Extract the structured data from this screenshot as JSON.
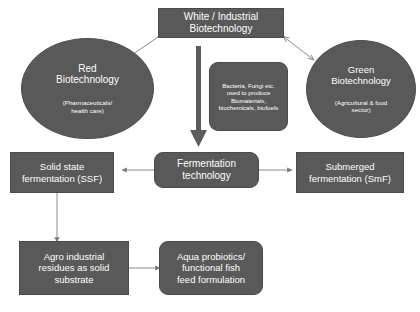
{
  "diagram": {
    "colors": {
      "node_fill": "#595959",
      "node_text": "#ffffff",
      "background": "#ffffff",
      "thin_arrow": "#808080",
      "thick_arrow": "#595959"
    },
    "nodes": {
      "white_industrial": {
        "label": "White / Industrial\nBiotechnology",
        "shape": "rect"
      },
      "red_biotech": {
        "label": "Red\nBiotechnology",
        "sublabel": "(Pharmaceuticals/\nhealth care)",
        "shape": "ellipse"
      },
      "green_biotech": {
        "label": "Green\nBiotechnology",
        "sublabel": "(Agricultural & food\nsector)",
        "shape": "ellipse"
      },
      "microbes": {
        "label": "Bacteria, Fungi etc.\nused to produce\nBiomaterials,\nbiochemicals, biofuels",
        "shape": "rounded"
      },
      "fermentation_technology": {
        "label": "Fermentation\ntechnology",
        "shape": "rounded"
      },
      "solid_state": {
        "label": "Solid state\nfermentation (SSF)",
        "shape": "rect"
      },
      "submerged": {
        "label": "Submerged\nfermentation (SmF)",
        "shape": "rect"
      },
      "agro_residues": {
        "label": "Agro industrial\nresidues as solid\nsubstrate",
        "shape": "rect"
      },
      "aqua_probiotics": {
        "label": "Aqua probiotics/\nfunctional fish\nfeed formulation",
        "shape": "rounded"
      }
    },
    "connectors": [
      {
        "name": "white-to-red",
        "from": "white_industrial",
        "to": "red_biotech",
        "style": "thin",
        "direction": "one-way"
      },
      {
        "name": "white-to-green",
        "from": "white_industrial",
        "to": "green_biotech",
        "style": "thin",
        "direction": "two-way"
      },
      {
        "name": "white-to-fermentation",
        "from": "white_industrial",
        "to": "fermentation_technology",
        "style": "thick",
        "direction": "one-way"
      },
      {
        "name": "fermentation-to-ssf",
        "from": "fermentation_technology",
        "to": "solid_state",
        "style": "thin",
        "direction": "one-way"
      },
      {
        "name": "fermentation-to-smf",
        "from": "fermentation_technology",
        "to": "submerged",
        "style": "thin",
        "direction": "one-way"
      },
      {
        "name": "ssf-to-agro",
        "from": "solid_state",
        "to": "agro_residues",
        "style": "thin",
        "direction": "one-way"
      },
      {
        "name": "agro-to-aqua",
        "from": "agro_residues",
        "to": "aqua_probiotics",
        "style": "thin",
        "direction": "one-way"
      }
    ]
  }
}
